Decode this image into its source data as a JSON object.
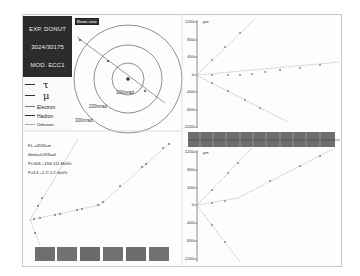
{
  "info_box": {
    "experiment": "EXP. DONUT",
    "event_id": "3024/30175",
    "module": "MOD. ECC1"
  },
  "legend": {
    "items": [
      {
        "label": "τ",
        "color": "#333333"
      },
      {
        "label": "μ",
        "color": "#333333"
      },
      {
        "label": "Electron",
        "color": "#777777"
      },
      {
        "label": "Hadron",
        "color": "#333333"
      },
      {
        "label": "Unknown",
        "color": "#aaaaaa"
      }
    ]
  },
  "beam_view": {
    "label": "Beam view",
    "rings": [
      "100mrad",
      "200mrad",
      "300mrad"
    ]
  },
  "parameters": {
    "flight_length": "F.L.=4535cm",
    "kink_angle": "θkink=0.093rad",
    "pt": "Pt>306 +194/-111 MeV/c",
    "p": "P=3.3 +1.7/-1.2 GeV/c"
  },
  "axes": {
    "unit": "μm",
    "y_ticks": [
      "1200",
      "800",
      "400",
      "0",
      "-400",
      "-800",
      "-1200"
    ]
  },
  "colors": {
    "background": "#ffffff",
    "info_box": "#2c2c2c",
    "detector_bar": "#6a6a6a",
    "track": "#555555"
  }
}
